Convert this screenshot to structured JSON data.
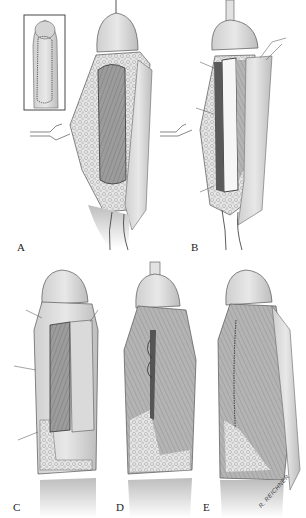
{
  "figure": {
    "panels": [
      {
        "label": "A"
      },
      {
        "label": "B"
      },
      {
        "label": "C"
      },
      {
        "label": "D"
      },
      {
        "label": "E"
      }
    ],
    "signature": "R. REICHNER",
    "colors": {
      "ink": "#2a2a2a",
      "skin": "#d9d9d9",
      "shade": "#8a8a8a",
      "dark": "#555555",
      "paper": "#ffffff"
    }
  }
}
